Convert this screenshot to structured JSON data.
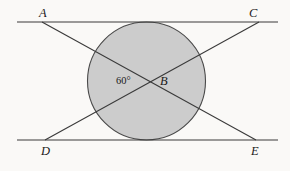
{
  "figure": {
    "background_color": "#faf9f7",
    "stroke_color": "#3a3a3a",
    "circle_fill_color": "#cccccc",
    "circle_stroke_color": "#4a4a4a",
    "width": 290,
    "height": 171
  },
  "labels": {
    "a": "A",
    "c": "C",
    "d": "D",
    "e": "E",
    "b": "B",
    "angle": "60°"
  },
  "chart_data": {
    "type": "diagram",
    "elements": [
      {
        "name": "top-parallel-line",
        "type": "segment",
        "x1": 17,
        "y1": 22,
        "x2": 278,
        "y2": 22,
        "passes_through_labels": [
          "A",
          "C"
        ]
      },
      {
        "name": "bottom-parallel-line",
        "type": "segment",
        "x1": 17,
        "y1": 140,
        "x2": 278,
        "y2": 140,
        "passes_through_labels": [
          "D",
          "E"
        ]
      },
      {
        "name": "transversal-A-to-E",
        "type": "segment",
        "x1": 42,
        "y1": 22,
        "x2": 256,
        "y2": 140,
        "from_label": "A",
        "to_label": "E"
      },
      {
        "name": "transversal-D-to-C",
        "type": "segment",
        "x1": 45,
        "y1": 140,
        "x2": 259,
        "y2": 22,
        "from_label": "D",
        "to_label": "C"
      },
      {
        "name": "tangent-circle",
        "type": "circle",
        "cx": 146.5,
        "cy": 81,
        "r": 59,
        "fill": "#cccccc",
        "tangent_to": [
          "top-parallel-line",
          "bottom-parallel-line"
        ]
      },
      {
        "name": "intersection-point-B",
        "type": "point",
        "x": 150,
        "y": 81,
        "label": "B"
      }
    ],
    "angles": [
      {
        "name": "angle-at-B",
        "vertex_label": "B",
        "value_deg": 60,
        "display": "60°",
        "position": {
          "x": 123,
          "y": 81
        }
      }
    ]
  }
}
